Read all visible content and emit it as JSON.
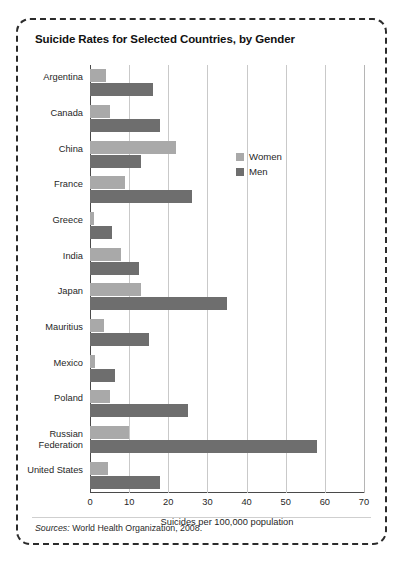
{
  "chart_data": {
    "type": "bar",
    "orientation": "horizontal",
    "title": "Suicide Rates for Selected Countries, by Gender",
    "xlabel": "Suicides per 100,000 population",
    "ylabel": "",
    "xlim": [
      0,
      70
    ],
    "xticks": [
      0,
      10,
      20,
      30,
      40,
      50,
      60,
      70
    ],
    "grid": "vertical",
    "legend_position": "inside-upper-right",
    "categories": [
      "Argentina",
      "Canada",
      "China",
      "France",
      "Greece",
      "India",
      "Japan",
      "Mauritius",
      "Mexico",
      "Poland",
      "Russian Federation",
      "United States"
    ],
    "series": [
      {
        "name": "Women",
        "color": "#a9a9a9",
        "values": [
          4,
          5,
          22,
          9,
          1,
          8,
          13,
          3.5,
          1.2,
          5,
          10,
          4.5
        ]
      },
      {
        "name": "Men",
        "color": "#6e6e6e",
        "values": [
          16,
          18,
          13,
          26,
          5.5,
          12.5,
          35,
          15,
          6.5,
          25,
          58,
          18
        ]
      }
    ],
    "source_label": "Sources:",
    "source_text": "World Health Organization, 2008."
  }
}
